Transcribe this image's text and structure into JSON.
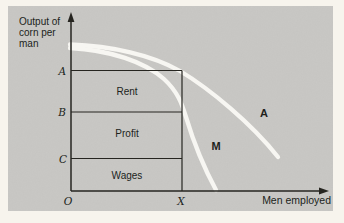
{
  "colors": {
    "panel": "#c9c8c5",
    "line": "#262520",
    "curve": "#f7f6f2",
    "text": "#201f1b",
    "page": "#f7f4ed"
  },
  "y_axis": {
    "label_lines": [
      "Output of",
      "corn per",
      "man"
    ],
    "point_labels": {
      "a": "A",
      "b": "B",
      "c": "C"
    }
  },
  "x_axis": {
    "label": "Men employed",
    "origin": "O",
    "point_x": "X"
  },
  "regions": {
    "rent": "Rent",
    "profit": "Profit",
    "wages": "Wages"
  },
  "curves": {
    "outer": "A",
    "inner": "M"
  }
}
